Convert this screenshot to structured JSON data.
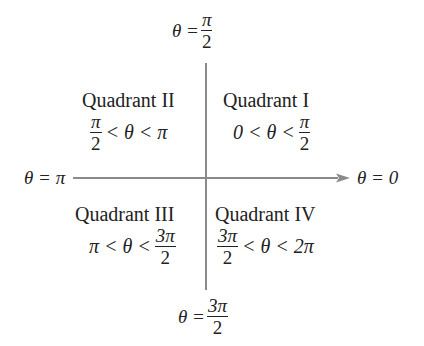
{
  "diagram": {
    "axes": {
      "top": {
        "lhs": "θ =",
        "num": "π",
        "den": "2"
      },
      "bottom": {
        "lhs": "θ =",
        "num": "3π",
        "den": "2"
      },
      "left": {
        "text": "θ = π"
      },
      "right": {
        "text": "θ = 0"
      }
    },
    "quadrants": [
      {
        "name": "Quadrant I",
        "ineq": {
          "a": "0 < θ <",
          "num": "π",
          "den": "2"
        }
      },
      {
        "name": "Quadrant II",
        "ineq": {
          "num": "π",
          "den": "2",
          "b": "< θ < π"
        }
      },
      {
        "name": "Quadrant III",
        "ineq": {
          "a": "π < θ <",
          "num": "3π",
          "den": "2"
        }
      },
      {
        "name": "Quadrant IV",
        "ineq": {
          "num": "3π",
          "den": "2",
          "b": "< θ < 2π"
        }
      }
    ],
    "colors": {
      "axis": "#8a8a8a",
      "text": "#222222"
    }
  }
}
